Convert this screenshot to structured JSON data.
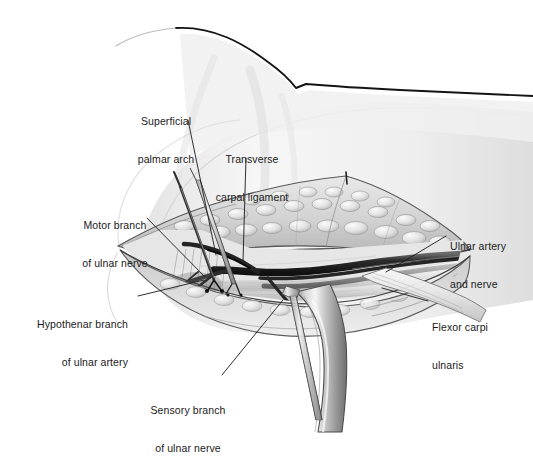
{
  "figure": {
    "type": "medical-illustration",
    "style": "grayscale pencil and wash anatomical drawing",
    "background_color": "#ffffff",
    "ink_color": "#1a1a1a"
  },
  "labels": [
    {
      "id": "superficial-palmar-arch",
      "line1": "Superficial",
      "line2": "palmar arch",
      "align": "center",
      "x": 134,
      "y": 90,
      "leader": {
        "x1": 188,
        "y1": 120,
        "x2": 216,
        "y2": 255
      }
    },
    {
      "id": "transverse-carpal-ligament",
      "line1": "Transverse",
      "line2": "carpal ligament",
      "align": "center",
      "x": 213,
      "y": 128,
      "leader": {
        "x1": 246,
        "y1": 158,
        "x2": 243,
        "y2": 262
      }
    },
    {
      "id": "motor-branch-of-ulnar-nerve",
      "line1": "Motor branch",
      "line2": "of ulnar nerve",
      "align": "center",
      "x": 76,
      "y": 194,
      "leader": {
        "x1": 147,
        "y1": 218,
        "x2": 205,
        "y2": 277
      }
    },
    {
      "id": "hypothenar-branch-of-ulnar-artery",
      "line1": "Hypothenar branch",
      "line2": "of ulnar artery",
      "align": "right",
      "x": 16,
      "y": 293,
      "leader": {
        "x1": 138,
        "y1": 296,
        "x2": 204,
        "y2": 280
      }
    },
    {
      "id": "ulnar-artery-and-nerve",
      "line1": "Ulnar artery",
      "line2": "and nerve",
      "align": "left",
      "x": 450,
      "y": 215,
      "leader": {
        "x1": 446,
        "y1": 236,
        "x2": 386,
        "y2": 272
      }
    },
    {
      "id": "flexor-carpi-ulnaris",
      "line1": "Flexor carpi",
      "line2": "ulnaris",
      "align": "left",
      "x": 432,
      "y": 296,
      "leader": {
        "x1": 428,
        "y1": 301,
        "x2": 382,
        "y2": 288
      }
    },
    {
      "id": "sensory-branch-of-ulnar-nerve",
      "line1": "Sensory branch",
      "line2": "of ulnar nerve",
      "align": "center",
      "x": 144,
      "y": 379,
      "leader": {
        "x1": 222,
        "y1": 375,
        "x2": 283,
        "y2": 300
      }
    }
  ],
  "structures": {
    "forearm_outline": "dark contour sweeping from upper-left across to right edge with a vertex near x=290",
    "wound": "elliptical surgical incision with retracted skin and subcutaneous fat flaps above and below",
    "retractor_metal": "curved steel retractor blade descending from wound to lower right",
    "rakes": "two thin double-pronged skin hooks entering from upper left and from below center",
    "vessels": "dark ulnar artery and nerve bundle running right to left, branching near mid-wound"
  }
}
